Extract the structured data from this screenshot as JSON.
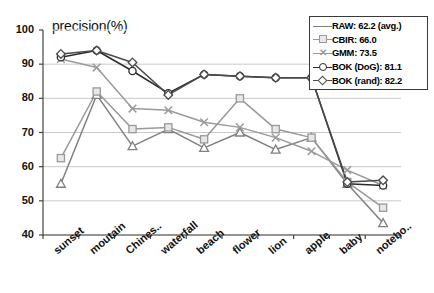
{
  "chart_data": {
    "type": "line",
    "title": "precision(%)",
    "xlabel": "",
    "ylabel": "precision(%)",
    "ylim": [
      40,
      100
    ],
    "ytick_step": 10,
    "yticks": [
      100,
      90,
      80,
      70,
      60,
      50,
      40
    ],
    "grid": true,
    "legend_position": "top-right",
    "categories": [
      "sunset",
      "moutain",
      "Chines..",
      "waterfall",
      "beach",
      "flower",
      "lion",
      "apple",
      "baby",
      "notebo.."
    ],
    "series": [
      {
        "name": "RAW",
        "legend_label": "RAW: 62.2 (avg.)",
        "average": 62.2,
        "marker": "triangle",
        "color": "#808080",
        "values": [
          55.0,
          81.0,
          66.0,
          71.0,
          65.5,
          70.0,
          65.0,
          68.5,
          55.0,
          43.5
        ]
      },
      {
        "name": "CBIR",
        "legend_label": "CBIR: 66.0",
        "average": 66.0,
        "marker": "square",
        "color": "#999999",
        "values": [
          62.5,
          82.0,
          71.0,
          71.5,
          68.0,
          80.0,
          71.0,
          68.5,
          55.5,
          48.0
        ]
      },
      {
        "name": "GMM",
        "legend_label": "GMM: 73.5",
        "average": 73.5,
        "marker": "cross",
        "color": "#9a9a9a",
        "values": [
          91.5,
          89.0,
          77.0,
          76.5,
          73.0,
          71.5,
          68.5,
          64.5,
          59.0,
          54.5
        ]
      },
      {
        "name": "BOK (DoG)",
        "legend_label": "BOK (DoG): 81.1",
        "average": 81.1,
        "marker": "circle",
        "color": "#2b2b2b",
        "values": [
          92.0,
          94.0,
          88.0,
          81.5,
          87.0,
          86.5,
          86.0,
          86.0,
          55.0,
          54.5
        ]
      },
      {
        "name": "BOK (rand)",
        "legend_label": "BOK (rand): 82.2",
        "average": 82.2,
        "marker": "diamond",
        "color": "#4a4a4a",
        "values": [
          93.0,
          94.0,
          90.5,
          81.0,
          87.0,
          86.5,
          86.0,
          86.0,
          55.5,
          56.0
        ]
      }
    ]
  }
}
